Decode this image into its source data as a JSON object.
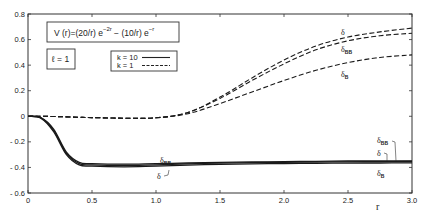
{
  "chart_data": {
    "type": "line",
    "formula": {
      "prefix": "V (r)=(20/r)  e",
      "exp1": "−2r",
      "middle": " − (10/r)  e",
      "exp2": "−r"
    },
    "annotation": "ℓ = 1",
    "xlabel": "r",
    "ylabel": "",
    "xlim": [
      0,
      3.0
    ],
    "ylim": [
      -0.6,
      0.8
    ],
    "x_ticks": [
      "0",
      "0.5",
      "1.0",
      "1.5",
      "2.0",
      "2.5",
      "3.0"
    ],
    "y_ticks": [
      "0.8",
      "0.6",
      "0.4",
      "0.2",
      "0",
      "- 0.2",
      "- 0.4",
      "- 0.6"
    ],
    "grid": false,
    "legend": {
      "position": "upper-center",
      "entries": [
        {
          "label": "k = 10",
          "style": "solid"
        },
        {
          "label": "k = 1",
          "style": "dashed"
        }
      ]
    },
    "x": [
      0,
      0.1,
      0.2,
      0.3,
      0.4,
      0.5,
      0.75,
      1.0,
      1.25,
      1.5,
      1.75,
      2.0,
      2.25,
      2.5,
      2.75,
      3.0
    ],
    "series": [
      {
        "name": "δ (k=1)",
        "style": "dashed",
        "values": [
          0,
          0,
          -0.002,
          -0.005,
          -0.008,
          -0.01,
          -0.015,
          -0.012,
          0.03,
          0.15,
          0.3,
          0.44,
          0.55,
          0.62,
          0.66,
          0.69
        ]
      },
      {
        "name": "δ_BB (k=1)",
        "style": "dashed",
        "values": [
          0,
          0,
          -0.002,
          -0.005,
          -0.008,
          -0.01,
          -0.015,
          -0.012,
          0.03,
          0.14,
          0.28,
          0.41,
          0.52,
          0.59,
          0.63,
          0.65
        ]
      },
      {
        "name": "δ_B (k=1)",
        "style": "dashed",
        "values": [
          0,
          0,
          -0.002,
          -0.005,
          -0.008,
          -0.01,
          -0.015,
          -0.012,
          0.02,
          0.1,
          0.19,
          0.28,
          0.36,
          0.42,
          0.46,
          0.48
        ]
      },
      {
        "name": "δ_BB (k=10)",
        "style": "solid",
        "values": [
          0,
          -0.01,
          -0.1,
          -0.28,
          -0.36,
          -0.37,
          -0.375,
          -0.37,
          -0.365,
          -0.36,
          -0.357,
          -0.355,
          -0.352,
          -0.35,
          -0.349,
          -0.348
        ]
      },
      {
        "name": "δ (k=10)",
        "style": "solid",
        "values": [
          0,
          -0.012,
          -0.11,
          -0.29,
          -0.37,
          -0.38,
          -0.385,
          -0.38,
          -0.372,
          -0.366,
          -0.362,
          -0.36,
          -0.358,
          -0.356,
          -0.355,
          -0.354
        ]
      },
      {
        "name": "δ_B (k=10)",
        "style": "solid",
        "values": [
          0,
          -0.014,
          -0.12,
          -0.3,
          -0.38,
          -0.39,
          -0.395,
          -0.39,
          -0.382,
          -0.376,
          -0.372,
          -0.37,
          -0.368,
          -0.366,
          -0.365,
          -0.364
        ]
      }
    ],
    "curve_labels": [
      {
        "text": "δ",
        "sub": "",
        "near": "upper δ (k=1)"
      },
      {
        "text": "δ",
        "sub": "BB",
        "near": "upper δ_BB (k=1)"
      },
      {
        "text": "δ",
        "sub": "B",
        "near": "upper δ_B (k=1)"
      },
      {
        "text": "δ",
        "sub": "BB",
        "near": "lower middle"
      },
      {
        "text": "δ",
        "sub": "",
        "near": "lower middle"
      },
      {
        "text": "δ",
        "sub": "BB",
        "near": "lower right"
      },
      {
        "text": "δ",
        "sub": "",
        "near": "lower right"
      },
      {
        "text": "δ",
        "sub": "B",
        "near": "lower right"
      }
    ]
  }
}
